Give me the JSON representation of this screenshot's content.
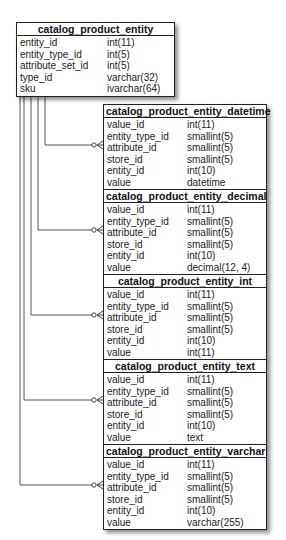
{
  "parent_table": {
    "name": "catalog_product_entity",
    "columns": [
      {
        "name": "entity_id",
        "type": "int(11)"
      },
      {
        "name": "entity_type_id",
        "type": "int(5)"
      },
      {
        "name": "attribute_set_id",
        "type": "int(5)"
      },
      {
        "name": "type_id",
        "type": "varchar(32)"
      },
      {
        "name": "sku",
        "type": "ivarchar(64)"
      }
    ]
  },
  "child_tables": [
    {
      "name": "catalog_product_entity_datetime",
      "columns": [
        {
          "name": "value_id",
          "type": "int(11)"
        },
        {
          "name": "entity_type_id",
          "type": "smallint(5)"
        },
        {
          "name": "attribute_id",
          "type": "smallint(5)"
        },
        {
          "name": "store_id",
          "type": "smallint(5)"
        },
        {
          "name": "entity_id",
          "type": "int(10)"
        },
        {
          "name": "value",
          "type": "datetime"
        }
      ]
    },
    {
      "name": "catalog_product_entity_decimal",
      "columns": [
        {
          "name": "value_id",
          "type": "int(11)"
        },
        {
          "name": "entity_type_id",
          "type": "smallint(5)"
        },
        {
          "name": "attribute_id",
          "type": "smallint(5)"
        },
        {
          "name": "store_id",
          "type": "smallint(5)"
        },
        {
          "name": "entity_id",
          "type": "int(10)"
        },
        {
          "name": "value",
          "type": "decimal(12, 4)"
        }
      ]
    },
    {
      "name": "catalog_product_entity_int",
      "columns": [
        {
          "name": "value_id",
          "type": "int(11)"
        },
        {
          "name": "entity_type_id",
          "type": "smallint(5)"
        },
        {
          "name": "attribute_id",
          "type": "smallint(5)"
        },
        {
          "name": "store_id",
          "type": "smallint(5)"
        },
        {
          "name": "entity_id",
          "type": "int(10)"
        },
        {
          "name": "value",
          "type": "int(11)"
        }
      ]
    },
    {
      "name": "catalog_product_entity_text",
      "columns": [
        {
          "name": "value_id",
          "type": "int(11)"
        },
        {
          "name": "entity_type_id",
          "type": "smallint(5)"
        },
        {
          "name": "attribute_id",
          "type": "smallint(5)"
        },
        {
          "name": "store_id",
          "type": "smallint(5)"
        },
        {
          "name": "entity_id",
          "type": "int(10)"
        },
        {
          "name": "value",
          "type": "text"
        }
      ]
    },
    {
      "name": "catalog_product_entity_varchar",
      "columns": [
        {
          "name": "value_id",
          "type": "int(11)"
        },
        {
          "name": "entity_type_id",
          "type": "smallint(5)"
        },
        {
          "name": "attribute_id",
          "type": "smallint(5)"
        },
        {
          "name": "store_id",
          "type": "smallint(5)"
        },
        {
          "name": "entity_id",
          "type": "int(10)"
        },
        {
          "name": "value",
          "type": "varchar(255)"
        }
      ]
    }
  ],
  "relationship": {
    "notation": "one-to-many (zero or many)",
    "line_color": "#555555"
  }
}
